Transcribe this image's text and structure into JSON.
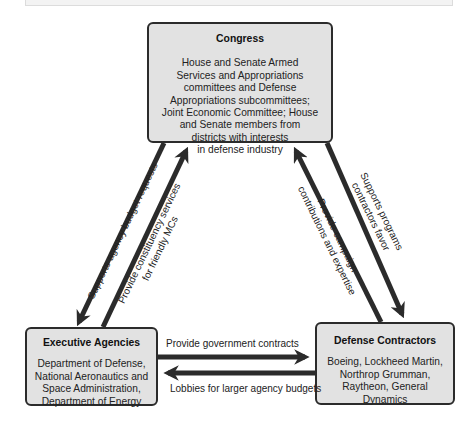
{
  "diagram": {
    "type": "iron-triangle",
    "colors": {
      "node_fill": "#e2e2e2",
      "node_border": "#2b2b2b",
      "arrow": "#2b2b2b",
      "background": "#ffffff"
    },
    "nodes": {
      "congress": {
        "title": "Congress",
        "body": "House and Senate Armed Services and Appropriations committees and Defense Appropriations subcommittees; Joint Economic Committee; House and Senate members from districts with interests in defense industry",
        "lines": [
          "House and Senate Armed",
          "Services and Appropriations",
          "committees and Defense",
          "Appropriations subcommittees;",
          "Joint Economic Committee; House",
          "and Senate members from",
          "districts with interests",
          "in defense industry"
        ]
      },
      "executive_agencies": {
        "title": "Executive Agencies",
        "lines": [
          "Department of Defense,",
          "National Aeronautics and",
          "Space Administration,",
          "Department of Energy"
        ]
      },
      "defense_contractors": {
        "title": "Defense Contractors",
        "lines": [
          "Boeing, Lockheed Martin,",
          "Northrop Grumman,",
          "Raytheon, General Dynamics"
        ]
      }
    },
    "edges": [
      {
        "id": "congress-to-exec",
        "from": "Congress",
        "to": "Executive Agencies",
        "label": "Supports agency budget requests"
      },
      {
        "id": "exec-to-congress",
        "from": "Executive Agencies",
        "to": "Congress",
        "label_lines": [
          "Provide constituency services",
          "for friendly MCs"
        ]
      },
      {
        "id": "contractors-to-congress",
        "from": "Defense Contractors",
        "to": "Congress",
        "label_lines": [
          "Provide campaign",
          "contributions and expertise"
        ]
      },
      {
        "id": "congress-to-contractors",
        "from": "Congress",
        "to": "Defense Contractors",
        "label_lines": [
          "Supports programs",
          "contractors favor"
        ]
      },
      {
        "id": "exec-to-contractors",
        "from": "Executive Agencies",
        "to": "Defense Contractors",
        "label": "Provide government contracts"
      },
      {
        "id": "contractors-to-exec",
        "from": "Defense Contractors",
        "to": "Executive Agencies",
        "label": "Lobbies for larger agency budgets"
      }
    ]
  }
}
